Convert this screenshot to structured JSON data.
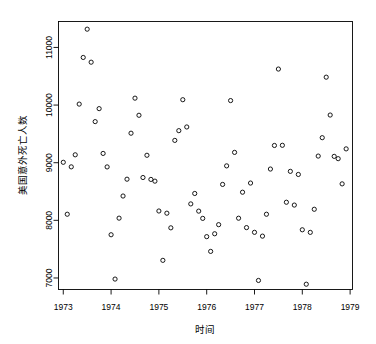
{
  "chart_data": {
    "type": "scatter",
    "title": "",
    "xlabel": "时间",
    "ylabel": "美国意外死亡人数",
    "xlim": [
      1972.9,
      1979.05
    ],
    "ylim": [
      6800,
      11450
    ],
    "grid": false,
    "legend": "none",
    "marker": "open-circle",
    "marker_color": "#000000",
    "xticks": [
      1973,
      1974,
      1975,
      1976,
      1977,
      1978,
      1979
    ],
    "xtick_labels": [
      "1973",
      "1974",
      "1975",
      "1976",
      "1977",
      "1978",
      "1979"
    ],
    "yticks": [
      7000,
      8000,
      9000,
      10000,
      11000
    ],
    "ytick_labels": [
      "7000",
      "8000",
      "9000",
      "10000",
      "11000"
    ],
    "x": [
      1973.0,
      1973.083,
      1973.167,
      1973.25,
      1973.333,
      1973.417,
      1973.5,
      1973.583,
      1973.667,
      1973.75,
      1973.833,
      1973.917,
      1974.0,
      1974.083,
      1974.167,
      1974.25,
      1974.333,
      1974.417,
      1974.5,
      1974.583,
      1974.667,
      1974.75,
      1974.833,
      1974.917,
      1975.0,
      1975.083,
      1975.167,
      1975.25,
      1975.333,
      1975.417,
      1975.5,
      1975.583,
      1975.667,
      1975.75,
      1975.833,
      1975.917,
      1976.0,
      1976.083,
      1976.167,
      1976.25,
      1976.333,
      1976.417,
      1976.5,
      1976.583,
      1976.667,
      1976.75,
      1976.833,
      1976.917,
      1977.0,
      1977.083,
      1977.167,
      1977.25,
      1977.333,
      1977.417,
      1977.5,
      1977.583,
      1977.667,
      1977.75,
      1977.833,
      1977.917,
      1978.0,
      1978.083,
      1978.167,
      1978.25,
      1978.333,
      1978.417,
      1978.5,
      1978.583,
      1978.667,
      1978.75,
      1978.833,
      1978.917
    ],
    "y": [
      9007,
      8106,
      8928,
      9137,
      10017,
      10826,
      11317,
      10744,
      9713,
      9938,
      9161,
      8927,
      7750,
      6981,
      8038,
      8422,
      8714,
      9512,
      10120,
      9823,
      8743,
      9129,
      8710,
      8680,
      8162,
      7306,
      8124,
      7870,
      9387,
      9556,
      10093,
      9620,
      8285,
      8466,
      8160,
      8034,
      7717,
      7461,
      7767,
      7925,
      8623,
      8945,
      10078,
      9179,
      8037,
      8488,
      7874,
      8647,
      7792,
      6957,
      7726,
      8106,
      8890,
      9299,
      10625,
      9302,
      8314,
      8850,
      8265,
      8796,
      7836,
      6892,
      7791,
      8192,
      9115,
      9434,
      10484,
      9827,
      9110,
      9070,
      8633,
      9240
    ],
    "n_points": 72
  },
  "figure": {
    "background": "#ffffff",
    "axis_color": "#000000",
    "point_color": "#000000"
  }
}
